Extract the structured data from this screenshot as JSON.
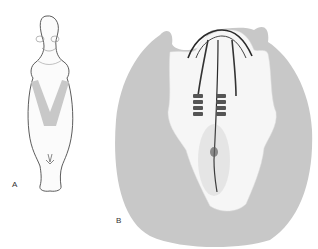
{
  "figure": {
    "panels": [
      {
        "label": "A",
        "description": "Whole embryo, dorsal view, with V-shaped shaded region"
      },
      {
        "label": "B",
        "description": "Embryo disc with neural folds and somites, surrounded by shaded area"
      }
    ],
    "colors": {
      "shade": "#c8c8c8",
      "outline": "#555555",
      "ink": "#2a2a2a",
      "stipple": "#f4f4f4"
    }
  }
}
